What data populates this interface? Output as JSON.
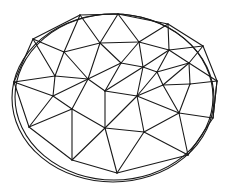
{
  "diagram": {
    "title": "",
    "type": "triangulated-mesh-in-ellipse",
    "style": {
      "stroke": "#1a1a1a",
      "background": "#ffffff"
    },
    "outline": [
      {
        "cx": 113,
        "cy": 98,
        "rx": 101,
        "ry": 84
      },
      {
        "cx": 114,
        "cy": 97,
        "rx": 99,
        "ry": 83
      }
    ],
    "vertices": [
      [
        80,
        15
      ],
      [
        118,
        14
      ],
      [
        168,
        24
      ],
      [
        33,
        39
      ],
      [
        14,
        82
      ],
      [
        203,
        46
      ],
      [
        217,
        81
      ],
      [
        213,
        118
      ],
      [
        188,
        155
      ],
      [
        117,
        173
      ],
      [
        72,
        160
      ],
      [
        29,
        127
      ],
      [
        64,
        52
      ],
      [
        100,
        43
      ],
      [
        139,
        42
      ],
      [
        55,
        76
      ],
      [
        88,
        79
      ],
      [
        121,
        63
      ],
      [
        143,
        67
      ],
      [
        157,
        72
      ],
      [
        169,
        50
      ],
      [
        189,
        63
      ],
      [
        53,
        96
      ],
      [
        72,
        109
      ],
      [
        105,
        91
      ],
      [
        137,
        96
      ],
      [
        163,
        85
      ],
      [
        190,
        84
      ],
      [
        179,
        113
      ],
      [
        105,
        128
      ],
      [
        144,
        132
      ]
    ],
    "edges": [
      [
        0,
        1
      ],
      [
        1,
        2
      ],
      [
        0,
        3
      ],
      [
        3,
        4
      ],
      [
        4,
        11
      ],
      [
        11,
        10
      ],
      [
        10,
        9
      ],
      [
        9,
        8
      ],
      [
        8,
        7
      ],
      [
        7,
        6
      ],
      [
        6,
        5
      ],
      [
        5,
        2
      ],
      [
        0,
        12
      ],
      [
        3,
        12
      ],
      [
        0,
        13
      ],
      [
        1,
        13
      ],
      [
        1,
        14
      ],
      [
        2,
        14
      ],
      [
        2,
        20
      ],
      [
        5,
        20
      ],
      [
        5,
        21
      ],
      [
        6,
        21
      ],
      [
        12,
        13
      ],
      [
        13,
        14
      ],
      [
        14,
        20
      ],
      [
        12,
        15
      ],
      [
        3,
        15
      ],
      [
        4,
        15
      ],
      [
        12,
        16
      ],
      [
        13,
        16
      ],
      [
        13,
        17
      ],
      [
        14,
        17
      ],
      [
        14,
        18
      ],
      [
        15,
        16
      ],
      [
        16,
        17
      ],
      [
        17,
        18
      ],
      [
        18,
        19
      ],
      [
        19,
        20
      ],
      [
        20,
        21
      ],
      [
        19,
        21
      ],
      [
        18,
        20
      ],
      [
        4,
        22
      ],
      [
        15,
        22
      ],
      [
        16,
        22
      ],
      [
        16,
        23
      ],
      [
        22,
        23
      ],
      [
        16,
        24
      ],
      [
        17,
        24
      ],
      [
        18,
        24
      ],
      [
        24,
        25
      ],
      [
        18,
        25
      ],
      [
        19,
        25
      ],
      [
        19,
        26
      ],
      [
        21,
        26
      ],
      [
        21,
        27
      ],
      [
        6,
        27
      ],
      [
        26,
        27
      ],
      [
        25,
        26
      ],
      [
        22,
        11
      ],
      [
        23,
        11
      ],
      [
        23,
        10
      ],
      [
        23,
        29
      ],
      [
        24,
        29
      ],
      [
        25,
        29
      ],
      [
        25,
        30
      ],
      [
        26,
        28
      ],
      [
        25,
        28
      ],
      [
        27,
        28
      ],
      [
        28,
        7
      ],
      [
        6,
        7
      ],
      [
        28,
        8
      ],
      [
        30,
        28
      ],
      [
        29,
        30
      ],
      [
        30,
        9
      ],
      [
        29,
        9
      ],
      [
        30,
        8
      ],
      [
        29,
        10
      ]
    ]
  }
}
